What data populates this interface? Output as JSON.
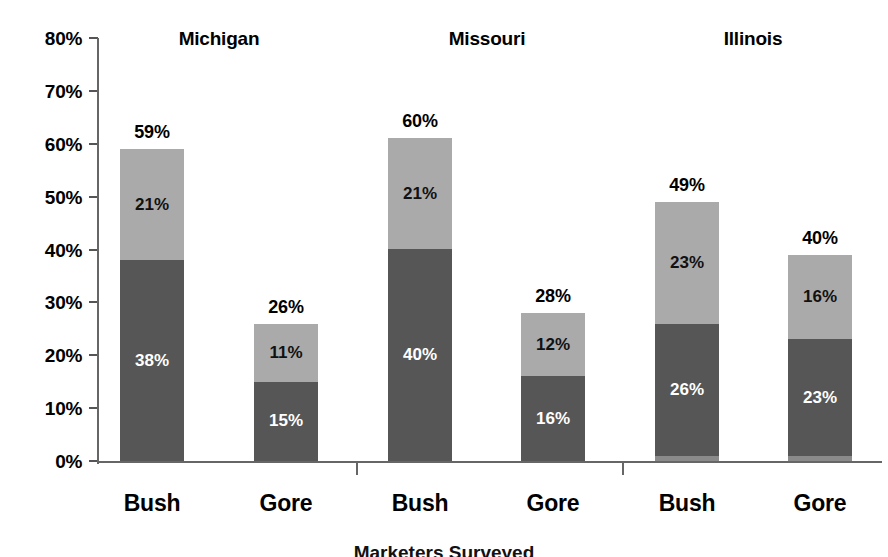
{
  "chart_data": {
    "type": "bar",
    "subtype": "stacked-bar-grouped",
    "title": "",
    "xlabel": "",
    "ylabel": "",
    "ylim": [
      0,
      80
    ],
    "grid": false,
    "legend": "none",
    "y_ticks": [
      "0%",
      "10%",
      "20%",
      "30%",
      "40%",
      "50%",
      "60%",
      "70%",
      "80%"
    ],
    "y_tick_values": [
      0,
      10,
      20,
      30,
      40,
      50,
      60,
      70,
      80
    ],
    "groups": [
      "Michigan",
      "Missouri",
      "Illinois"
    ],
    "categories": [
      "Bush",
      "Gore",
      "Bush",
      "Gore",
      "Bush",
      "Gore"
    ],
    "series": [
      {
        "name": "lower-segment",
        "color": "#565656",
        "values": [
          38,
          15,
          40,
          16,
          26,
          23
        ]
      },
      {
        "name": "upper-segment",
        "color": "#aaaaaa",
        "values": [
          21,
          11,
          21,
          12,
          23,
          16
        ]
      },
      {
        "name": "base-sliver",
        "color": "#8a8a8a",
        "values": [
          0,
          0,
          0,
          0,
          1,
          1
        ]
      }
    ],
    "totals": [
      59,
      26,
      60,
      28,
      49,
      40
    ],
    "bars": [
      {
        "group": "Michigan",
        "category": "Bush",
        "total": "59%",
        "total_value": 59,
        "segments": [
          {
            "label": "38%",
            "value": 38,
            "tone": "dark",
            "sliver": 0
          },
          {
            "label": "21%",
            "value": 21,
            "tone": "light"
          }
        ]
      },
      {
        "group": "Michigan",
        "category": "Gore",
        "total": "26%",
        "total_value": 26,
        "segments": [
          {
            "label": "15%",
            "value": 15,
            "tone": "dark",
            "sliver": 0
          },
          {
            "label": "11%",
            "value": 11,
            "tone": "light"
          }
        ]
      },
      {
        "group": "Missouri",
        "category": "Bush",
        "total": "60%",
        "total_value": 61,
        "segments": [
          {
            "label": "40%",
            "value": 40,
            "tone": "dark",
            "sliver": 0
          },
          {
            "label": "21%",
            "value": 21,
            "tone": "light"
          }
        ]
      },
      {
        "group": "Missouri",
        "category": "Gore",
        "total": "28%",
        "total_value": 28,
        "segments": [
          {
            "label": "16%",
            "value": 16,
            "tone": "dark",
            "sliver": 0
          },
          {
            "label": "12%",
            "value": 12,
            "tone": "light"
          }
        ]
      },
      {
        "group": "Illinois",
        "category": "Bush",
        "total": "49%",
        "total_value": 49,
        "segments": [
          {
            "label": "26%",
            "value": 25,
            "tone": "dark",
            "sliver": 1
          },
          {
            "label": "23%",
            "value": 23,
            "tone": "light"
          }
        ]
      },
      {
        "group": "Illinois",
        "category": "Gore",
        "total": "40%",
        "total_value": 39,
        "segments": [
          {
            "label": "23%",
            "value": 22,
            "tone": "dark",
            "sliver": 1
          },
          {
            "label": "16%",
            "value": 16,
            "tone": "light"
          }
        ]
      }
    ]
  },
  "colors": {
    "dark_segment": "#565656",
    "light_segment": "#aaaaaa",
    "sliver_segment": "#8a8a8a",
    "axis": "#666666",
    "text": "#000000",
    "background": "#ffffff"
  },
  "caption": {
    "text": "Marketers Surveyed"
  }
}
